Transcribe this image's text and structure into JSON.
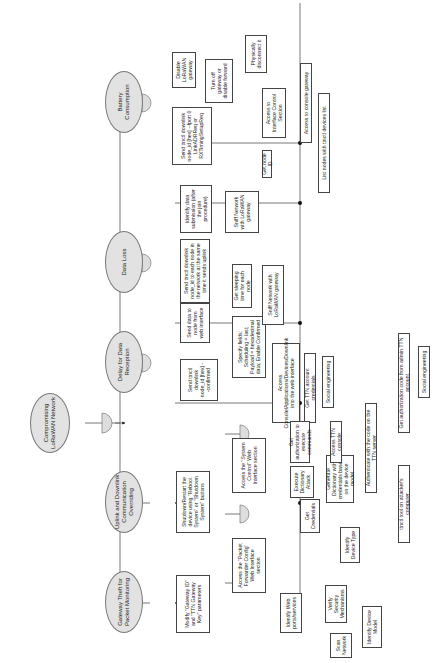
{
  "root": "Compromising LoRaWAN Network",
  "goals": [
    "Gateway Theft for Packet Monitoring",
    "Uplink and Downlink Communication Overriding",
    "Delay for Data Reception",
    "Data Loss",
    "Battery Consumption"
  ],
  "nodes": {
    "modify_gw": "Modify \"Gateway ID\" and \"TTN Gateway Key\" parameters",
    "shutdown": "Shutdown/Restart the device using \"Reboot System\" or \"Shutdown System\" buttons",
    "packet_fwd": "Access the \"Packet Forwarder Config\" Web Interface section",
    "system_ctrl": "Access the \"System Control\" Web Interface section",
    "identify_ports": "Identify Web ports/services",
    "scan_network": "Scan Network",
    "verify_security": "Verify Security Mechanisms",
    "identify_model": "Identify Device Model",
    "get_credentials": "Get Credentials",
    "dict_attack": "Execute Dictionary Attack",
    "gen_dict": "Generate Dictionary with credentials based on the device model",
    "identify_type": "Identify Device Type",
    "send_ttnctl_confirmed": "Send ttnctl downlink node_id [hex] --confirmed",
    "send_data_web": "Send data to node from web interface",
    "specify_fields": "Specify fields: Scheduling = last; Payload = hexadecimal data; Enable Confirmed",
    "access_console": "Access Console/Applications/Devices/Downlink into the web interface",
    "get_ttn_creds": "Get TTN account credentials",
    "social1": "Social engineering",
    "get_auth": "Get authorization to execute commands",
    "access_ttn_console": "Access TTN console",
    "authenticate": "Authenticate with the code on the TTN server",
    "ttnctl_tool": "ttnctl tool on attacker's computer",
    "get_auth_code": "Get authorization code from admin TTN account",
    "social2": "Social engineering",
    "send_ttnctl_each": "Send ttnctl downlink node_id to each node in the network at the same time it sends uplink",
    "get_sleeping": "Get sleeping time for each node",
    "sniff1": "Sniff Network with LoRaWAN gateway",
    "identify_submission": "Identify data submission (after the join procedure)",
    "sniff2": "Sniff Network with LoRaWAN gateway",
    "send_mac": "Send ttnctl downlink node_id [hex] --fport 0 LinkADRReq or RXTimingSetupReq",
    "disable_gw": "Disable LoRaWAN gateway",
    "turn_off": "Turn off gateway or disable forward",
    "physically": "Physically disconnect it",
    "access_iface": "Access to Interface Control Section",
    "access_console_gw": "Access to console gateway",
    "get_node_id": "Get node ID",
    "list_nodes": "List nodes with ttnctl devices list"
  }
}
